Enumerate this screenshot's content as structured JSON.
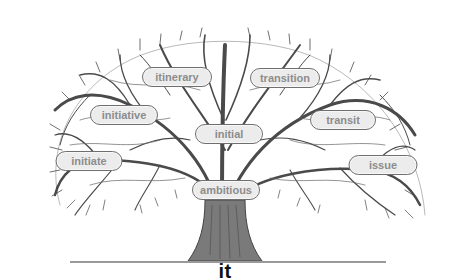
{
  "diagram": {
    "type": "word-tree",
    "root_word": "it",
    "colors": {
      "branch": "#4a4a4a",
      "trunk": "#5a5a5a",
      "pill_fill": "#ececec",
      "pill_border": "#6f6f6f",
      "pill_text": "#8c8c8c",
      "root_text": "#111111",
      "ground_line": "#9a9a9a"
    },
    "words": [
      {
        "label": "itinerary",
        "x": 177,
        "y": 77,
        "w": 68
      },
      {
        "label": "transition",
        "x": 285,
        "y": 78,
        "w": 68
      },
      {
        "label": "initiative",
        "x": 124,
        "y": 115,
        "w": 66
      },
      {
        "label": "transit",
        "x": 343,
        "y": 120,
        "w": 64
      },
      {
        "label": "initial",
        "x": 229,
        "y": 134,
        "w": 66
      },
      {
        "label": "initiate",
        "x": 89,
        "y": 161,
        "w": 65
      },
      {
        "label": "issue",
        "x": 383,
        "y": 165,
        "w": 67
      },
      {
        "label": "ambitious",
        "x": 226,
        "y": 190,
        "w": 66
      }
    ]
  }
}
